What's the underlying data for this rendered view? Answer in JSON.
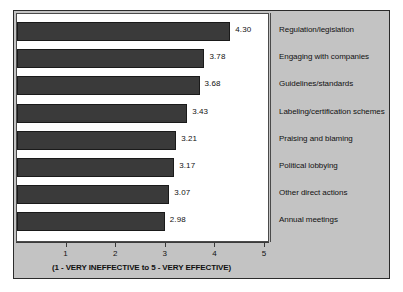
{
  "chart_data": {
    "type": "bar",
    "orientation": "horizontal",
    "title": "",
    "subtitle": "",
    "xlabel": "(1 - VERY INEFFECTIVE to 5 - VERY EFFECTIVE)",
    "ylabel": "",
    "xlim": [
      0,
      5
    ],
    "xticks": [
      1,
      2,
      3,
      4,
      5
    ],
    "xtick_labels": [
      "1",
      "2",
      "3",
      "4",
      "5"
    ],
    "grid": false,
    "legend": "none",
    "bar_color": "#3a3a3a",
    "panel_color": "#c3c3c3",
    "plot_background": "#ffffff",
    "categories": [
      "Regulation/legislation",
      "Engaging with companies",
      "Guidelines/standards",
      "Labeling/certification schemes",
      "Praising and blaming",
      "Political lobbying",
      "Other direct actions",
      "Annual meetings"
    ],
    "values": [
      4.3,
      3.78,
      3.68,
      3.43,
      3.21,
      3.17,
      3.07,
      2.98
    ],
    "value_labels": [
      "4.30",
      "3.78",
      "3.68",
      "3.43",
      "3.21",
      "3.17",
      "3.07",
      "2.98"
    ]
  }
}
